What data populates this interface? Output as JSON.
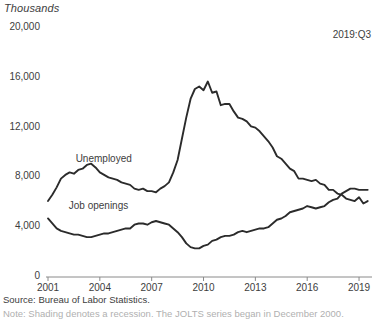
{
  "chart_data": {
    "type": "line",
    "title": "",
    "unit_label": "Thousands",
    "annotation": "2019:Q3",
    "xlabel": "",
    "ylabel": "Thousands",
    "grid": false,
    "legend_position": "inline-labels",
    "ylim": [
      0,
      20000
    ],
    "xlim": [
      2001.0,
      2019.75
    ],
    "yticks": [
      "0",
      "4,000",
      "8,000",
      "12,000",
      "16,000",
      "20,000"
    ],
    "ytick_values": [
      0,
      4000,
      8000,
      12000,
      16000,
      20000
    ],
    "xticks": [
      "2001",
      "2004",
      "2007",
      "2010",
      "2013",
      "2016",
      "2019"
    ],
    "xtick_values": [
      2001,
      2004,
      2007,
      2010,
      2013,
      2016,
      2019
    ],
    "series": [
      {
        "name": "Unemployed",
        "color": "#2b2b2b",
        "label_x": 2002.6,
        "label_y": 9400,
        "x": [
          2001.0,
          2001.25,
          2001.5,
          2001.75,
          2002.0,
          2002.25,
          2002.5,
          2002.75,
          2003.0,
          2003.25,
          2003.5,
          2003.75,
          2004.0,
          2004.25,
          2004.5,
          2004.75,
          2005.0,
          2005.25,
          2005.5,
          2005.75,
          2006.0,
          2006.25,
          2006.5,
          2006.75,
          2007.0,
          2007.25,
          2007.5,
          2007.75,
          2008.0,
          2008.25,
          2008.5,
          2008.75,
          2009.0,
          2009.25,
          2009.5,
          2009.75,
          2010.0,
          2010.25,
          2010.5,
          2010.75,
          2011.0,
          2011.25,
          2011.5,
          2011.75,
          2012.0,
          2012.25,
          2012.5,
          2012.75,
          2013.0,
          2013.25,
          2013.5,
          2013.75,
          2014.0,
          2014.25,
          2014.5,
          2014.75,
          2015.0,
          2015.25,
          2015.5,
          2015.75,
          2016.0,
          2016.25,
          2016.5,
          2016.75,
          2017.0,
          2017.25,
          2017.5,
          2017.75,
          2018.0,
          2018.25,
          2018.5,
          2018.75,
          2019.0,
          2019.25,
          2019.5
        ],
        "y": [
          6100,
          6600,
          7200,
          7900,
          8200,
          8400,
          8300,
          8600,
          8700,
          9000,
          9100,
          8800,
          8400,
          8200,
          8000,
          7900,
          7800,
          7600,
          7500,
          7400,
          7100,
          7000,
          7100,
          6900,
          6900,
          6800,
          7100,
          7300,
          7600,
          8400,
          9400,
          11100,
          12800,
          14300,
          15100,
          15300,
          15000,
          15700,
          14800,
          14900,
          13800,
          13900,
          13900,
          13300,
          12800,
          12700,
          12500,
          12100,
          12000,
          11700,
          11300,
          10900,
          10400,
          9700,
          9500,
          9100,
          8700,
          8500,
          7900,
          7900,
          7800,
          7700,
          7800,
          7500,
          7400,
          7000,
          7000,
          6700,
          6600,
          6300,
          6200,
          6100,
          6400,
          5900,
          6100
        ]
      },
      {
        "name": "Job openings",
        "color": "#2b2b2b",
        "label_x": 2002.2,
        "label_y": 5600,
        "x": [
          2001.0,
          2001.25,
          2001.5,
          2001.75,
          2002.0,
          2002.25,
          2002.5,
          2002.75,
          2003.0,
          2003.25,
          2003.5,
          2003.75,
          2004.0,
          2004.25,
          2004.5,
          2004.75,
          2005.0,
          2005.25,
          2005.5,
          2005.75,
          2006.0,
          2006.25,
          2006.5,
          2006.75,
          2007.0,
          2007.25,
          2007.5,
          2007.75,
          2008.0,
          2008.25,
          2008.5,
          2008.75,
          2009.0,
          2009.25,
          2009.5,
          2009.75,
          2010.0,
          2010.25,
          2010.5,
          2010.75,
          2011.0,
          2011.25,
          2011.5,
          2011.75,
          2012.0,
          2012.25,
          2012.5,
          2012.75,
          2013.0,
          2013.25,
          2013.5,
          2013.75,
          2014.0,
          2014.25,
          2014.5,
          2014.75,
          2015.0,
          2015.25,
          2015.5,
          2015.75,
          2016.0,
          2016.25,
          2016.5,
          2016.75,
          2017.0,
          2017.25,
          2017.5,
          2017.75,
          2018.0,
          2018.25,
          2018.5,
          2018.75,
          2019.0,
          2019.25,
          2019.5
        ],
        "y": [
          4700,
          4300,
          3900,
          3700,
          3600,
          3500,
          3400,
          3400,
          3300,
          3200,
          3200,
          3300,
          3400,
          3500,
          3500,
          3600,
          3700,
          3800,
          3900,
          3900,
          4200,
          4300,
          4300,
          4200,
          4400,
          4500,
          4400,
          4300,
          4200,
          3900,
          3600,
          3200,
          2700,
          2400,
          2300,
          2300,
          2500,
          2600,
          2900,
          3000,
          3200,
          3300,
          3300,
          3400,
          3600,
          3700,
          3600,
          3700,
          3800,
          3900,
          3900,
          4000,
          4300,
          4600,
          4700,
          4900,
          5200,
          5300,
          5400,
          5500,
          5700,
          5600,
          5500,
          5600,
          5700,
          6000,
          6200,
          6300,
          6700,
          6900,
          7100,
          7100,
          7000,
          7000,
          7000
        ]
      }
    ],
    "source": "Source: Bureau of Labor Statistics.",
    "note": "Note: Shading denotes a recession. The JOLTS series began in December 2000."
  }
}
